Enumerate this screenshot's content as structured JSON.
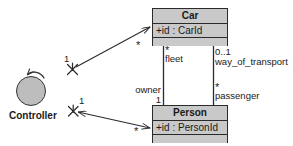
{
  "diagram": {
    "background_color": "#ffffff",
    "line_color": "#2b2b2b",
    "box_fill_color": "#c9c9c9",
    "actor_fill_color": "#bdbdbd"
  },
  "classes": [
    {
      "id": "car",
      "name": "Car",
      "attribute": "+id : CarId"
    },
    {
      "id": "person",
      "name": "Person",
      "attribute": "+id : PersonId"
    }
  ],
  "actors": [
    {
      "id": "controller",
      "label": "Controller",
      "icon": "circle-with-rotate-arrow"
    }
  ],
  "associations": {
    "fleet": {
      "role": "fleet",
      "role_multiplicity": "*",
      "opposite_role": "owner",
      "opposite_multiplicity": "1"
    },
    "transport": {
      "role": "way_of_transport",
      "role_multiplicity": "0..1",
      "opposite_role": "passenger",
      "opposite_multiplicity": "*"
    },
    "controller_to_car": {
      "source_multiplicity": "1",
      "target_multiplicity": "*"
    },
    "controller_to_person": {
      "source_multiplicity": "1",
      "target_multiplicity": "*"
    }
  }
}
